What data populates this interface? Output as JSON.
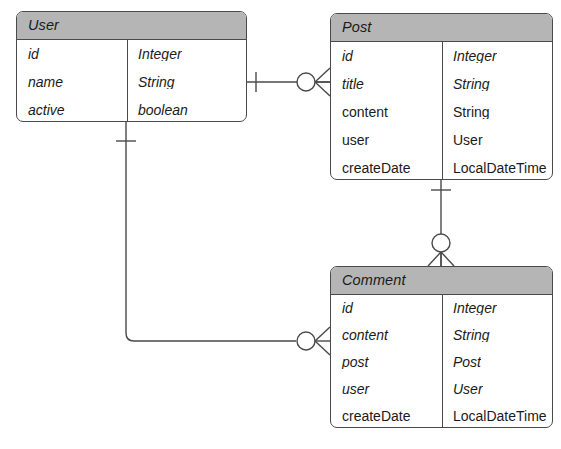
{
  "diagram": {
    "type": "entity-relationship-diagram",
    "notation": "crows-foot",
    "background_color": "#ffffff",
    "header_fill": "#b5b5b5",
    "line_color": "#4a4a4a",
    "entities": [
      {
        "id": "user",
        "name": "User",
        "name_italic": true,
        "x": 16,
        "y": 11,
        "width": 231,
        "height": 111,
        "divider_offset": 110,
        "header_height": 26,
        "row_height": 28,
        "rows": [
          {
            "field": "id",
            "type": "Integer",
            "field_italic": true,
            "type_italic": true
          },
          {
            "field": "name",
            "type": "String",
            "field_italic": true,
            "type_italic": true
          },
          {
            "field": "active",
            "type": "boolean",
            "field_italic": true,
            "type_italic": true
          }
        ]
      },
      {
        "id": "post",
        "name": "Post",
        "name_italic": true,
        "x": 330,
        "y": 13,
        "width": 223,
        "height": 167,
        "divider_offset": 111,
        "header_height": 26,
        "row_height": 28,
        "rows": [
          {
            "field": "id",
            "type": "Integer",
            "field_italic": true,
            "type_italic": true
          },
          {
            "field": "title",
            "type": "String",
            "field_italic": true,
            "type_italic": true
          },
          {
            "field": "content",
            "type": "String",
            "field_italic": false,
            "type_italic": false
          },
          {
            "field": "user",
            "type": "User",
            "field_italic": false,
            "type_italic": false
          },
          {
            "field": "createDate",
            "type": "LocalDateTime",
            "field_italic": false,
            "type_italic": false
          }
        ]
      },
      {
        "id": "comment",
        "name": "Comment",
        "name_italic": true,
        "x": 330,
        "y": 266,
        "width": 223,
        "height": 162,
        "divider_offset": 111,
        "header_height": 26,
        "row_height": 27,
        "rows": [
          {
            "field": "id",
            "type": "Integer",
            "field_italic": true,
            "type_italic": true
          },
          {
            "field": "content",
            "type": "String",
            "field_italic": true,
            "type_italic": true
          },
          {
            "field": "post",
            "type": "Post",
            "field_italic": true,
            "type_italic": true
          },
          {
            "field": "user",
            "type": "User",
            "field_italic": true,
            "type_italic": true
          },
          {
            "field": "createDate",
            "type": "LocalDateTime",
            "field_italic": false,
            "type_italic": false
          }
        ]
      }
    ],
    "relationships": [
      {
        "id": "user-post",
        "from": "user",
        "to": "post",
        "from_cardinality": "one",
        "to_cardinality": "zero-or-many",
        "orientation": "horizontal"
      },
      {
        "id": "post-comment",
        "from": "post",
        "to": "comment",
        "from_cardinality": "one",
        "to_cardinality": "zero-or-many",
        "orientation": "vertical"
      },
      {
        "id": "user-comment",
        "from": "user",
        "to": "comment",
        "from_cardinality": "one",
        "to_cardinality": "zero-or-many",
        "orientation": "elbow"
      }
    ]
  }
}
